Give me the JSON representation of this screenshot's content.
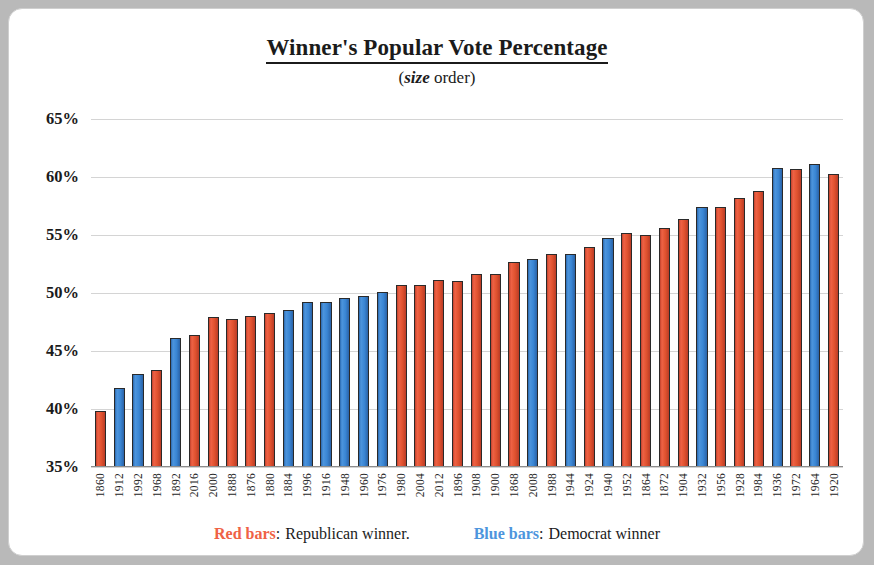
{
  "chart_data": {
    "type": "bar",
    "title": "Winner's Popular Vote Percentage",
    "subtitle_prefix": "(",
    "subtitle_emphasis": "size",
    "subtitle_suffix": " order)",
    "xlabel": "",
    "ylabel": "",
    "ylim": [
      35,
      65
    ],
    "ytick_step": 5,
    "grid": true,
    "ytick_labels": [
      "65%",
      "60%",
      "55%",
      "50%",
      "45%",
      "40%",
      "35%"
    ],
    "yticks": [
      65,
      60,
      55,
      50,
      45,
      40,
      35
    ],
    "legend_position": "bottom",
    "colors": {
      "republican": "#e0522f",
      "democrat": "#3a86d4",
      "bar_outline": "#2a2a2a",
      "gridline": "#d4d4d4",
      "text": "#1b1b1b",
      "card_background": "#ffffff",
      "page_background": "#b9b9b9"
    },
    "categories": [
      "1860",
      "1912",
      "1992",
      "1968",
      "1892",
      "2016",
      "2000",
      "1888",
      "1876",
      "1880",
      "1884",
      "1996",
      "1916",
      "1948",
      "1960",
      "1976",
      "1980",
      "2004",
      "2012",
      "1896",
      "1908",
      "1900",
      "1868",
      "2008",
      "1988",
      "1944",
      "1924",
      "1940",
      "1952",
      "1864",
      "1872",
      "1904",
      "1932",
      "1956",
      "1928",
      "1984",
      "1936",
      "1972",
      "1964",
      "1920"
    ],
    "values": [
      39.8,
      41.8,
      43.0,
      43.4,
      46.1,
      46.4,
      47.9,
      47.8,
      48.0,
      48.3,
      48.5,
      49.2,
      49.2,
      49.6,
      49.7,
      50.1,
      50.7,
      50.7,
      51.1,
      51.0,
      51.6,
      51.6,
      52.7,
      52.9,
      53.4,
      53.4,
      54.0,
      54.7,
      55.2,
      55.0,
      55.6,
      56.4,
      57.4,
      57.4,
      58.2,
      58.8,
      60.8,
      60.7,
      61.1,
      60.3
    ],
    "parties": [
      "R",
      "D",
      "D",
      "R",
      "D",
      "R",
      "R",
      "R",
      "R",
      "R",
      "D",
      "D",
      "D",
      "D",
      "D",
      "D",
      "R",
      "R",
      "R",
      "R",
      "R",
      "R",
      "R",
      "D",
      "R",
      "D",
      "R",
      "D",
      "R",
      "R",
      "R",
      "R",
      "D",
      "R",
      "R",
      "R",
      "D",
      "R",
      "D",
      "R"
    ],
    "legend": [
      {
        "swatch_label": "Red bars",
        "color": "#ef6245",
        "separator": ":",
        "description": "Republican winner."
      },
      {
        "swatch_label": "Blue bars",
        "color": "#4d95dd",
        "separator": ":",
        "description": "Democrat winner"
      }
    ]
  }
}
